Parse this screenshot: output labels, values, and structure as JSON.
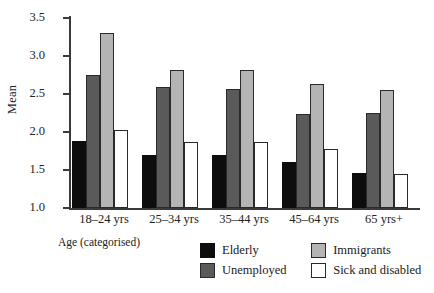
{
  "chart_data": {
    "type": "bar",
    "title": "",
    "xlabel": "Age (categorised)",
    "ylabel": "Mean",
    "categories": [
      "18–24 yrs",
      "25–34 yrs",
      "35–44 yrs",
      "45–64 yrs",
      "65 yrs+"
    ],
    "series": [
      {
        "name": "Elderly",
        "color": "#0d0d0d",
        "values": [
          1.88,
          1.7,
          1.7,
          1.6,
          1.46
        ]
      },
      {
        "name": "Unemployed",
        "color": "#5a5a5a",
        "values": [
          2.75,
          2.59,
          2.57,
          2.24,
          2.25
        ]
      },
      {
        "name": "Immigrants",
        "color": "#b4b4b4",
        "values": [
          3.3,
          2.81,
          2.81,
          2.63,
          2.55
        ]
      },
      {
        "name": "Sick and disabled",
        "color": "#ffffff",
        "values": [
          2.03,
          1.87,
          1.87,
          1.77,
          1.45
        ]
      }
    ],
    "ylim": [
      1.0,
      3.5
    ],
    "ytick_labels": [
      "3.5",
      "3.0",
      "2.5",
      "2.0",
      "1.5",
      "1.0"
    ],
    "ytick_values": [
      3.5,
      3.0,
      2.5,
      2.0,
      1.5,
      1.0
    ],
    "grid": false,
    "legend_position": "bottom-right",
    "legend_order": [
      "Elderly",
      "Immigrants",
      "Unemployed",
      "Sick and disabled"
    ]
  },
  "axis": {
    "y_title": "Mean",
    "x_title": "Age (categorised)"
  },
  "legend": {
    "entries": [
      {
        "label": "Elderly",
        "swatch": "elderly"
      },
      {
        "label": "Immigrants",
        "swatch": "immigrants"
      },
      {
        "label": "Unemployed",
        "swatch": "unemployed"
      },
      {
        "label": "Sick and disabled",
        "swatch": "sick"
      }
    ]
  }
}
